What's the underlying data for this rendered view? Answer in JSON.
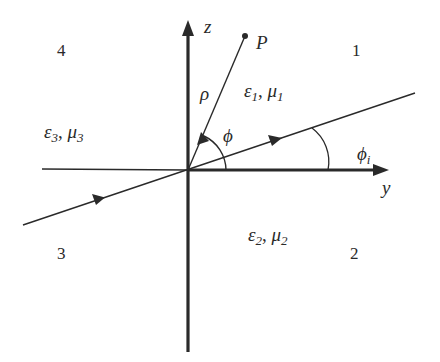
{
  "diagram": {
    "axes": {
      "vertical": {
        "label": "z"
      },
      "horizontal": {
        "label": "y"
      }
    },
    "point": {
      "label": "P"
    },
    "radial_label": "ρ",
    "angles": {
      "phi": "ϕ",
      "phi_i": {
        "base": "ϕ",
        "sub": "i"
      }
    },
    "regions": [
      {
        "id": "1",
        "label": "1",
        "medium": {
          "eps": "ε",
          "eps_sub": "1",
          "mu": "μ",
          "mu_sub": "1"
        }
      },
      {
        "id": "2",
        "label": "2",
        "medium": {
          "eps": "ε",
          "eps_sub": "2",
          "mu": "μ",
          "mu_sub": "2"
        }
      },
      {
        "id": "3",
        "label": "3",
        "medium": {
          "eps": "ε",
          "eps_sub": "3",
          "mu": "μ",
          "mu_sub": "3"
        }
      },
      {
        "id": "4",
        "label": "4"
      }
    ],
    "separator": ", ",
    "colors": {
      "ink": "#2a2a2a",
      "background": "#ffffff"
    }
  }
}
